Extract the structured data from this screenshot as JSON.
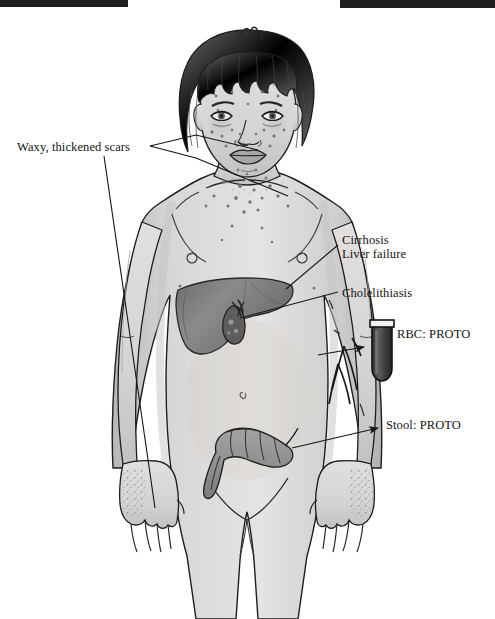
{
  "document": {
    "type": "medical-illustration",
    "subject": "Anterior view of female figure with porphyria findings",
    "background_color": "#ffffff",
    "ink_color": "#151515"
  },
  "redactions": [
    {
      "name": "top-left-bar",
      "color": "#1f1f1f"
    },
    {
      "name": "top-right-bar",
      "color": "#1f1f1f"
    }
  ],
  "annotations": {
    "waxy_scars": "Waxy, thickened scars",
    "cirrhosis": "Cirrhosis",
    "liver_failure": "Liver failure",
    "cholelithiasis": "Cholelithiasis",
    "rbc_proto": "RBC:  PROTO",
    "stool_proto": "Stool:  PROTO"
  },
  "anatomy": {
    "liver_label": "liver",
    "gallbladder_label": "gallbladder",
    "colon_label": "sigmoid-colon",
    "skin_fill": "#d8d6d4",
    "organ_fill": "#8e8c8a",
    "tube_fill": "#4a4a4a"
  },
  "specimen_tube": {
    "name": "test-tube",
    "contents_color": "#4a4a4a",
    "outline_color": "#1a1a1a"
  }
}
